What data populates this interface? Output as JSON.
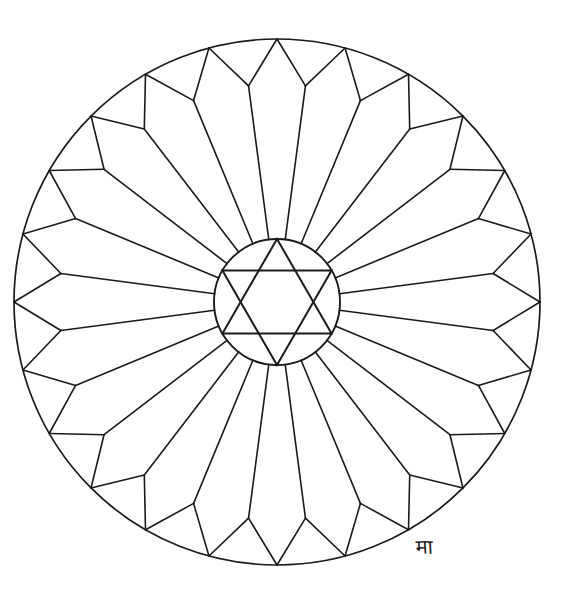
{
  "document": {
    "type": "mandala-coloring-page",
    "title": "Geometric Rose Window Mandala",
    "canvas": {
      "width": 572,
      "height": 601,
      "background": "#ffffff"
    }
  },
  "style": {
    "stroke_color": "#1a1a1c",
    "fill_color": "none",
    "outer_ring_stroke_width": 1.7,
    "spoke_stroke_width": 1.6,
    "petal_stroke_width": 1.6,
    "inner_circle_stroke_width": 1.9,
    "star_stroke_width": 2.0
  },
  "geometry": {
    "center": {
      "x": 277,
      "y": 302
    },
    "outer_circle": {
      "radius": 263,
      "label": "outer-boundary-circle"
    },
    "inner_circle": {
      "radius": 63,
      "label": "inner-hub-circle"
    },
    "petal_count": 24,
    "petal_tip_radius": 218,
    "spoke_start_radius": 63,
    "angular_offset_degrees": -97.5,
    "star": {
      "type": "hexagram",
      "points": 6,
      "circumradius": 63,
      "up_triangle_angles_degrees": [
        -90,
        30,
        150
      ],
      "down_triangle_angles_degrees": [
        90,
        -150,
        -30
      ]
    }
  },
  "signature": {
    "present": true,
    "glyph": "मा",
    "description": "handwritten-artist-monogram",
    "position": {
      "x": 416,
      "y": 537
    },
    "font_size": 20,
    "rotation_degrees": -3
  },
  "chart_data": {
    "type": "radial-geometry",
    "elements": [
      {
        "name": "outer-boundary-circle",
        "count": 1,
        "radius": 263
      },
      {
        "name": "inner-hub-circle",
        "count": 1,
        "radius": 63
      },
      {
        "name": "radial-spoke",
        "count": 24,
        "from_radius": 63,
        "to_radius": 218
      },
      {
        "name": "petal-chevron-edge",
        "count": 48,
        "from_radius": 218,
        "to_radius": 263
      },
      {
        "name": "hexagram-triangle",
        "count": 2,
        "radius": 63
      }
    ]
  }
}
